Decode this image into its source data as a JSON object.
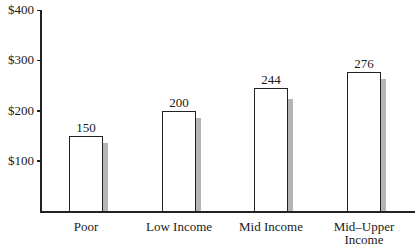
{
  "chart_data": {
    "type": "bar",
    "title": "",
    "xlabel": "",
    "ylabel": "",
    "categories": [
      "Poor",
      "Low Income",
      "Mid Income",
      "Mid–Upper Income"
    ],
    "series": [
      {
        "name": "primary",
        "values": [
          150,
          200,
          244,
          276
        ],
        "color": "#ffffff",
        "labeled": true
      },
      {
        "name": "secondary (shadow)",
        "values": [
          135,
          186,
          222,
          262
        ],
        "color": "#b5b5b5",
        "labeled": false
      }
    ],
    "ylim": [
      0,
      400
    ],
    "yticks": [
      100,
      200,
      300,
      400
    ],
    "ytick_labels": [
      "$100",
      "$200",
      "$300",
      "$400"
    ],
    "value_labels": [
      "150",
      "200",
      "244",
      "276"
    ],
    "grid": false,
    "legend": null
  },
  "category_labels": [
    {
      "line1": "Poor",
      "line2": ""
    },
    {
      "line1": "Low Income",
      "line2": ""
    },
    {
      "line1": "Mid Income",
      "line2": ""
    },
    {
      "line1": "Mid–Upper",
      "line2": "Income"
    }
  ]
}
